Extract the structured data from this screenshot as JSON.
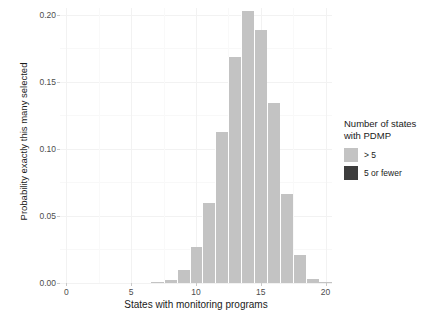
{
  "chart_data": {
    "type": "bar",
    "title": "",
    "subtitle": "",
    "xlabel": "States with monitoring programs",
    "ylabel": "Probability exactly this many selected",
    "xlim": [
      -0.5,
      20.5
    ],
    "ylim": [
      0.0,
      0.205
    ],
    "xticks": [
      "0",
      "5",
      "10",
      "15",
      "20"
    ],
    "xtick_values": [
      0,
      5,
      10,
      15,
      20
    ],
    "yticks": [
      "0.00",
      "0.05",
      "0.10",
      "0.15",
      "0.20"
    ],
    "ytick_values": [
      0.0,
      0.05,
      0.1,
      0.15,
      0.2
    ],
    "grid": true,
    "legend_position": "right",
    "categories": [
      0,
      1,
      2,
      3,
      4,
      5,
      6,
      7,
      8,
      9,
      10,
      11,
      12,
      13,
      14,
      15,
      16,
      17,
      18,
      19,
      20
    ],
    "values": [
      0.0,
      0.0,
      0.0,
      0.0,
      0.0,
      0.0,
      0.0,
      0.0005,
      0.0022,
      0.0096,
      0.0272,
      0.0599,
      0.1128,
      0.1683,
      0.2029,
      0.1888,
      0.1342,
      0.0662,
      0.0209,
      0.0032,
      0.0004
    ],
    "bar_colors": [
      "#c3c3c3",
      "#c3c3c3",
      "#c3c3c3",
      "#c3c3c3",
      "#c3c3c3",
      "#c3c3c3",
      "#c3c3c3",
      "#c3c3c3",
      "#c3c3c3",
      "#c3c3c3",
      "#c3c3c3",
      "#c3c3c3",
      "#c3c3c3",
      "#c3c3c3",
      "#c3c3c3",
      "#c3c3c3",
      "#c3c3c3",
      "#c3c3c3",
      "#c3c3c3",
      "#c3c3c3",
      "#c3c3c3"
    ],
    "series": [
      {
        "name": "> 5",
        "color": "#c3c3c3",
        "values": [
          0.0,
          0.0,
          0.0,
          0.0,
          0.0,
          0.0,
          0.0,
          0.0005,
          0.0022,
          0.0096,
          0.0272,
          0.0599,
          0.1128,
          0.1683,
          0.2029,
          0.1888,
          0.1342,
          0.0662,
          0.0209,
          0.0032,
          0.0004
        ]
      },
      {
        "name": "5 or fewer",
        "color": "#3d3d3d",
        "values": [
          0.0,
          0.0,
          0.0,
          0.0,
          0.0,
          0.0,
          0.0,
          0.0,
          0.0,
          0.0,
          0.0,
          0.0,
          0.0,
          0.0,
          0.0,
          0.0,
          0.0,
          0.0,
          0.0,
          0.0,
          0.0
        ]
      }
    ]
  },
  "legend": {
    "title": "Number of states\nwith PDMP",
    "items": [
      {
        "label": "> 5",
        "color": "#c3c3c3"
      },
      {
        "label": "5 or fewer",
        "color": "#3d3d3d"
      }
    ]
  },
  "axes": {
    "x_title": "States with monitoring programs",
    "y_title": "Probability exactly this many selected"
  },
  "colors": {
    "background": "#ffffff",
    "bar_light": "#c3c3c3",
    "bar_dark": "#3d3d3d",
    "grid": "#f2f2f2",
    "text": "#1a1a1a",
    "tick_text": "#4d4d4d"
  }
}
